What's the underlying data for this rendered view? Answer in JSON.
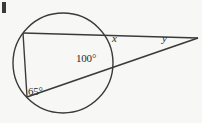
{
  "figure": {
    "type": "circle-geometry-diagram",
    "background_color": "#f7f7f5",
    "stroke_color": "#3a3a3a",
    "labels": {
      "angle_interior": "100°",
      "angle_inscribed": "65°",
      "unknown_x": "x",
      "unknown_y": "y"
    },
    "corner_mark": {
      "present": true,
      "color": "#3a3a3a"
    },
    "geometry": {
      "circle": {
        "cx": 63,
        "cy": 63,
        "r": 50
      },
      "points": {
        "upper_left_on_circle": {
          "x": 23,
          "y": 33
        },
        "lower_left_on_circle": {
          "x": 27,
          "y": 97
        },
        "right_upper_on_circle": {
          "x": 108,
          "y": 38
        },
        "right_lower_on_circle": {
          "x": 110,
          "y": 68
        },
        "external_apex": {
          "x": 198,
          "y": 38
        }
      },
      "segments": [
        {
          "name": "top-chord-to-apex",
          "from": "upper_left_on_circle",
          "to": "external_apex"
        },
        {
          "name": "left-chord",
          "from": "upper_left_on_circle",
          "to": "lower_left_on_circle"
        },
        {
          "name": "secant-to-apex",
          "from": "lower_left_on_circle",
          "to": "external_apex"
        }
      ]
    }
  }
}
